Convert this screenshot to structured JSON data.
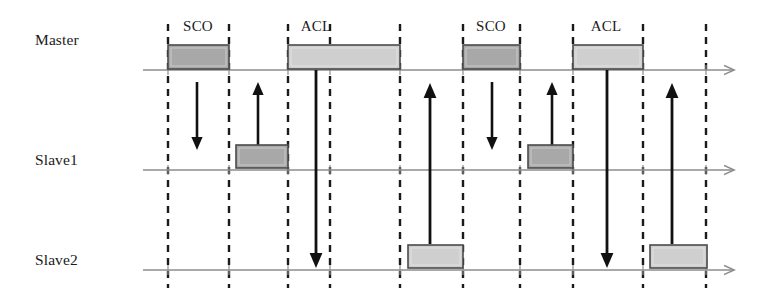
{
  "figure": {
    "kind": "timing-diagram",
    "width": 770,
    "height": 300,
    "background": "#ffffff"
  },
  "colors": {
    "timeline": "#8c8c8c",
    "slot_divider": "#1a1a1a",
    "arrow": "#111111",
    "sco_fill": "#a8a8a8",
    "acl_fill": "#cfcfcf",
    "box_stroke": "#4a4a4a",
    "text": "#1b1b1b"
  },
  "lanes": [
    {
      "id": "master",
      "label": "Master",
      "y": 70,
      "label_x": 35,
      "label_y": 31,
      "axis_x1": 143,
      "axis_x2": 733
    },
    {
      "id": "slave1",
      "label": "Slave1",
      "y": 170,
      "label_x": 35,
      "label_y": 151,
      "axis_x1": 143,
      "axis_x2": 733
    },
    {
      "id": "slave2",
      "label": "Slave2",
      "y": 270,
      "label_x": 35,
      "label_y": 251,
      "axis_x1": 143,
      "axis_x2": 733
    }
  ],
  "slot_dividers": {
    "x_positions": [
      168,
      229,
      288,
      330,
      400,
      463,
      520,
      573,
      643,
      706
    ],
    "y_top": 24,
    "y_bottom": 288,
    "dash": "7 6",
    "width": 2.4
  },
  "packets": [
    {
      "id": "sco-master-1",
      "type": "SCO",
      "lane": "master",
      "x": 168,
      "width": 61,
      "y": 45,
      "height": 24,
      "fill": "sco_fill",
      "label": "SCO",
      "label_x": 198,
      "label_y": 18
    },
    {
      "id": "acl-master-1",
      "type": "ACL",
      "lane": "master",
      "x": 288,
      "width": 112,
      "y": 45,
      "height": 24,
      "fill": "acl_fill",
      "label": "ACL",
      "label_x": 316,
      "label_y": 18
    },
    {
      "id": "sco-master-2",
      "type": "SCO",
      "lane": "master",
      "x": 463,
      "width": 57,
      "y": 45,
      "height": 24,
      "fill": "sco_fill",
      "label": "SCO",
      "label_x": 491,
      "label_y": 18
    },
    {
      "id": "acl-master-2",
      "type": "ACL",
      "lane": "master",
      "x": 573,
      "width": 70,
      "y": 45,
      "height": 24,
      "fill": "acl_fill",
      "label": "ACL",
      "label_x": 606,
      "label_y": 18
    },
    {
      "id": "sco-slave1-1",
      "type": "SCO",
      "lane": "slave1",
      "x": 236,
      "width": 52,
      "y": 145,
      "height": 23,
      "fill": "sco_fill",
      "label": null
    },
    {
      "id": "sco-slave1-2",
      "type": "SCO",
      "lane": "slave1",
      "x": 528,
      "width": 45,
      "y": 145,
      "height": 23,
      "fill": "sco_fill",
      "label": null
    },
    {
      "id": "acl-slave2-1",
      "type": "ACL",
      "lane": "slave2",
      "x": 408,
      "width": 55,
      "y": 245,
      "height": 23,
      "fill": "acl_fill",
      "label": null
    },
    {
      "id": "acl-slave2-2",
      "type": "ACL",
      "lane": "slave2",
      "x": 650,
      "width": 57,
      "y": 245,
      "height": 23,
      "fill": "acl_fill",
      "label": null
    }
  ],
  "transmissions": [
    {
      "id": "arrow-m-to-s1-sco1",
      "x": 197,
      "y_from": 82,
      "y_to": 150,
      "direction": "down",
      "thin": true
    },
    {
      "id": "arrow-s1-to-m-sco1",
      "x": 258,
      "y_from": 145,
      "y_to": 82,
      "direction": "up",
      "thin": true
    },
    {
      "id": "arrow-m-to-s2-acl1",
      "x": 316,
      "y_from": 70,
      "y_to": 268,
      "direction": "down",
      "thin": false
    },
    {
      "id": "arrow-s2-to-m-acl1",
      "x": 430,
      "y_from": 244,
      "y_to": 83,
      "direction": "up",
      "thin": false
    },
    {
      "id": "arrow-m-to-s1-sco2",
      "x": 492,
      "y_from": 82,
      "y_to": 150,
      "direction": "down",
      "thin": true
    },
    {
      "id": "arrow-s1-to-m-sco2",
      "x": 552,
      "y_from": 145,
      "y_to": 82,
      "direction": "up",
      "thin": true
    },
    {
      "id": "arrow-m-to-s2-acl2",
      "x": 607,
      "y_from": 70,
      "y_to": 268,
      "direction": "down",
      "thin": false
    },
    {
      "id": "arrow-s2-to-m-acl2",
      "x": 672,
      "y_from": 244,
      "y_to": 83,
      "direction": "up",
      "thin": false
    }
  ]
}
